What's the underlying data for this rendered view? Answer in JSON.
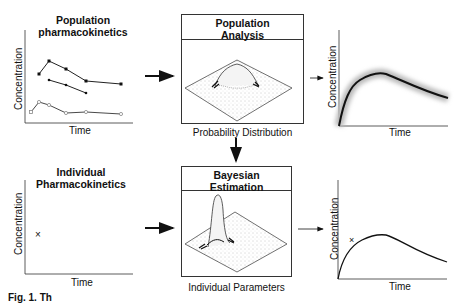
{
  "panels": {
    "pop_pk": {
      "title_line1": "Population",
      "title_line2": "pharmacokinetics",
      "ylabel": "Concentration",
      "xlabel": "Time"
    },
    "pop_analysis": {
      "title_line1": "Population",
      "title_line2": "Analysis",
      "caption": "Probability Distribution"
    },
    "pop_curve": {
      "ylabel": "Concentration",
      "xlabel": "Time"
    },
    "ind_pk": {
      "title_line1": "Individual",
      "title_line2": "Pharmacokinetics",
      "ylabel": "Concentration",
      "xlabel": "Time",
      "marker": "×"
    },
    "bayes": {
      "title_line1": "Bayesian",
      "title_line2": "Estimation",
      "caption": "Individual Parameters"
    },
    "ind_curve": {
      "ylabel": "Concentration",
      "xlabel": "Time",
      "marker": "×"
    }
  },
  "figure_caption": "Fig. 1. Th",
  "colors": {
    "ink": "#111111",
    "stipple": "#777777",
    "open_marker": "#999999"
  }
}
